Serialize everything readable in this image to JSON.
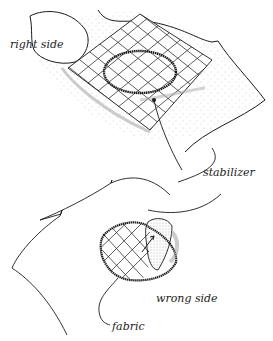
{
  "diagram": {
    "top_panel": {
      "labels": {
        "right_side": "right side",
        "stabilizer": "stabilizer"
      }
    },
    "bottom_panel": {
      "labels": {
        "wrong_side": "wrong side",
        "fabric": "fabric"
      }
    },
    "colors": {
      "ink": "#1a1a1a",
      "paper": "#ffffff",
      "stipple": "#777777"
    }
  }
}
